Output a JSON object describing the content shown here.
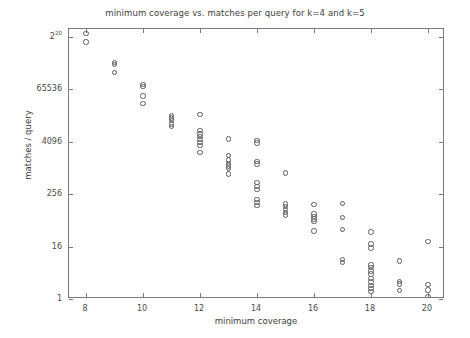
{
  "chart_data": {
    "type": "scatter",
    "title": "minimum coverage vs. matches per query for k=4 and k=5",
    "xlabel": "minimum coverage",
    "ylabel": "matches / query",
    "xlim": [
      7.4,
      20.6
    ],
    "ylim_log2": [
      0,
      20.6
    ],
    "yscale": "log",
    "grid": false,
    "legend": null,
    "xticks": [
      8,
      10,
      12,
      14,
      16,
      18,
      20
    ],
    "xticklabels": [
      "8",
      "10",
      "12",
      "14",
      "16",
      "18",
      "20"
    ],
    "yticks_log2": [
      0,
      4,
      8,
      12,
      16,
      20
    ],
    "yticklabels": [
      "1",
      "16",
      "256",
      "4096",
      "65536",
      "2^20"
    ],
    "ytick_top_base": "2",
    "ytick_top_exponent": "20",
    "marker": "open-circle",
    "marker_color": "#5c5c5c",
    "points": [
      {
        "x": 8,
        "y_log2": 20.25
      },
      {
        "x": 8,
        "y_log2": 19.6
      },
      {
        "x": 9,
        "y_log2": 18.05
      },
      {
        "x": 9,
        "y_log2": 17.9
      },
      {
        "x": 9,
        "y_log2": 17.3
      },
      {
        "x": 10,
        "y_log2": 16.35
      },
      {
        "x": 10,
        "y_log2": 16.2
      },
      {
        "x": 10,
        "y_log2": 15.5
      },
      {
        "x": 10,
        "y_log2": 14.9
      },
      {
        "x": 11,
        "y_log2": 14.0
      },
      {
        "x": 11,
        "y_log2": 13.8
      },
      {
        "x": 11,
        "y_log2": 13.6
      },
      {
        "x": 11,
        "y_log2": 13.35
      },
      {
        "x": 11,
        "y_log2": 13.15
      },
      {
        "x": 12,
        "y_log2": 14.1
      },
      {
        "x": 12,
        "y_log2": 12.85
      },
      {
        "x": 12,
        "y_log2": 12.6
      },
      {
        "x": 12,
        "y_log2": 12.4
      },
      {
        "x": 12,
        "y_log2": 12.15
      },
      {
        "x": 12,
        "y_log2": 11.95
      },
      {
        "x": 12,
        "y_log2": 11.7
      },
      {
        "x": 12,
        "y_log2": 11.2
      },
      {
        "x": 13,
        "y_log2": 12.2
      },
      {
        "x": 13,
        "y_log2": 10.95
      },
      {
        "x": 13,
        "y_log2": 10.6
      },
      {
        "x": 13,
        "y_log2": 10.35
      },
      {
        "x": 13,
        "y_log2": 10.15
      },
      {
        "x": 13,
        "y_log2": 9.95
      },
      {
        "x": 13,
        "y_log2": 9.55
      },
      {
        "x": 14,
        "y_log2": 12.1
      },
      {
        "x": 14,
        "y_log2": 11.9
      },
      {
        "x": 14,
        "y_log2": 10.5
      },
      {
        "x": 14,
        "y_log2": 10.3
      },
      {
        "x": 14,
        "y_log2": 8.9
      },
      {
        "x": 14,
        "y_log2": 8.6
      },
      {
        "x": 14,
        "y_log2": 8.35
      },
      {
        "x": 14,
        "y_log2": 7.6
      },
      {
        "x": 14,
        "y_log2": 7.35
      },
      {
        "x": 14,
        "y_log2": 7.15
      },
      {
        "x": 15,
        "y_log2": 9.6
      },
      {
        "x": 15,
        "y_log2": 7.25
      },
      {
        "x": 15,
        "y_log2": 7.05
      },
      {
        "x": 15,
        "y_log2": 6.85
      },
      {
        "x": 15,
        "y_log2": 6.6
      },
      {
        "x": 15,
        "y_log2": 6.4
      },
      {
        "x": 16,
        "y_log2": 7.2
      },
      {
        "x": 16,
        "y_log2": 6.5
      },
      {
        "x": 16,
        "y_log2": 6.3
      },
      {
        "x": 16,
        "y_log2": 6.1
      },
      {
        "x": 16,
        "y_log2": 5.9
      },
      {
        "x": 16,
        "y_log2": 5.2
      },
      {
        "x": 17,
        "y_log2": 7.3
      },
      {
        "x": 17,
        "y_log2": 6.2
      },
      {
        "x": 17,
        "y_log2": 5.3
      },
      {
        "x": 17,
        "y_log2": 3.0
      },
      {
        "x": 17,
        "y_log2": 2.8
      },
      {
        "x": 18,
        "y_log2": 5.1
      },
      {
        "x": 18,
        "y_log2": 4.2
      },
      {
        "x": 18,
        "y_log2": 3.9
      },
      {
        "x": 18,
        "y_log2": 2.6
      },
      {
        "x": 18,
        "y_log2": 2.4
      },
      {
        "x": 18,
        "y_log2": 2.15
      },
      {
        "x": 18,
        "y_log2": 1.9
      },
      {
        "x": 18,
        "y_log2": 1.55
      },
      {
        "x": 18,
        "y_log2": 1.3
      },
      {
        "x": 18,
        "y_log2": 1.05
      },
      {
        "x": 18,
        "y_log2": 0.8
      },
      {
        "x": 18,
        "y_log2": 0.55
      },
      {
        "x": 19,
        "y_log2": 2.9
      },
      {
        "x": 19,
        "y_log2": 1.35
      },
      {
        "x": 19,
        "y_log2": 1.15
      },
      {
        "x": 19,
        "y_log2": 0.65
      },
      {
        "x": 20,
        "y_log2": 4.4
      },
      {
        "x": 20,
        "y_log2": 1.1
      },
      {
        "x": 20,
        "y_log2": 0.7
      },
      {
        "x": 20,
        "y_log2": 0.15
      }
    ]
  }
}
